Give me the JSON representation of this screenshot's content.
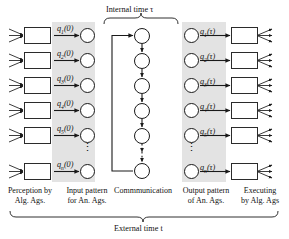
{
  "figure": {
    "top_label": "Internal time τ",
    "bottom_label": "External time t"
  },
  "columns": [
    {
      "id": "perception",
      "caption_line1": "Perception by",
      "caption_line2": "Alg.  Ags."
    },
    {
      "id": "input-pattern",
      "caption_line1": "Input pattern",
      "caption_line2": "for An.  Ags."
    },
    {
      "id": "communication",
      "caption_line1": "Commmunication",
      "caption_line2": ""
    },
    {
      "id": "output-pattern",
      "caption_line1": "Output pattern",
      "caption_line2": "of An.  Ags."
    },
    {
      "id": "executing",
      "caption_line1": "Executing",
      "caption_line2": "by Alg. Ags"
    }
  ],
  "input_states": [
    {
      "base": "q",
      "index": "1",
      "arg": "(0)"
    },
    {
      "base": "q",
      "index": "2",
      "arg": "(0)"
    },
    {
      "base": "q",
      "index": "3",
      "arg": "(0)"
    },
    {
      "base": "q",
      "index": "4",
      "arg": "(0)"
    },
    {
      "base": "q",
      "index": "5",
      "arg": "(0)"
    },
    {
      "base": "q",
      "index": "n",
      "arg": "(0)"
    }
  ],
  "output_states": [
    {
      "base": "q",
      "index": "1",
      "arg": "(τ)"
    },
    {
      "base": "q",
      "index": "2",
      "arg": "(τ)"
    },
    {
      "base": "q",
      "index": "3",
      "arg": "(τ)"
    },
    {
      "base": "q",
      "index": "4",
      "arg": "(τ)"
    },
    {
      "base": "q",
      "index": "5",
      "arg": "(τ)"
    },
    {
      "base": "q",
      "index": "n",
      "arg": "(τ)"
    }
  ],
  "ellipsis": {
    "input": "⋮",
    "output": "⋮"
  },
  "colors": {
    "band": "#e3e3e3",
    "stroke": "#1a1a1a",
    "text": "#111111",
    "background": "#ffffff"
  }
}
